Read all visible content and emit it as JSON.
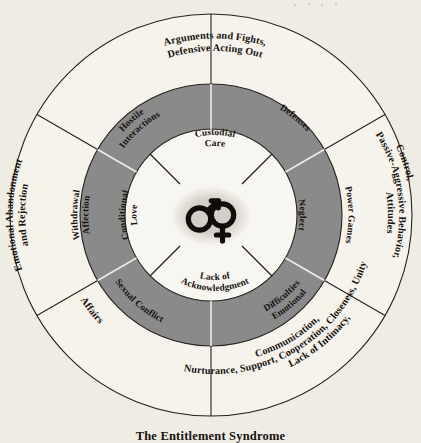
{
  "figure": {
    "caption": "The Entitlement Syndrome",
    "colors": {
      "background": "#efece4",
      "outer_ring": "#f6f3ec",
      "middle_ring": "#8a8a8a",
      "inner_circle": "#f8f6f0",
      "ink": "#16120e"
    }
  },
  "center": {
    "male_symbol": "male-gender-symbol",
    "female_symbol": "female-gender-symbol"
  },
  "inner_ring": {
    "name": "inner-circle-labels",
    "segments": [
      {
        "id": "custodial-care",
        "lines": [
          "Custodial",
          "Care"
        ]
      },
      {
        "id": "neglect",
        "lines": [
          "Neglect"
        ]
      },
      {
        "id": "lack-of-acknowledgment",
        "lines": [
          "Lack of",
          "Acknowledgment"
        ]
      },
      {
        "id": "conditional-love",
        "lines": [
          "Conditional",
          "Love"
        ]
      }
    ]
  },
  "middle_ring": {
    "name": "middle-gray-ring",
    "segments": [
      {
        "id": "defenses",
        "lines": [
          "Defenses"
        ]
      },
      {
        "id": "power-games",
        "lines": [
          "Power Games"
        ]
      },
      {
        "id": "emotional-difficulties",
        "lines": [
          "Emotional",
          "Difficulties"
        ]
      },
      {
        "id": "sexual-conflict",
        "lines": [
          "Sexual Conflict"
        ]
      },
      {
        "id": "withdrawal-affection",
        "lines": [
          "Withdrawal",
          "Affection"
        ]
      },
      {
        "id": "hostile-interactions",
        "lines": [
          "Hostile",
          "Interactions"
        ]
      }
    ]
  },
  "outer_ring": {
    "name": "outer-white-ring",
    "segments": [
      {
        "id": "arguments-and-fights",
        "lines": [
          "Arguments and Fights,",
          "Defensive Acting Out"
        ]
      },
      {
        "id": "control-passive-aggressive",
        "lines": [
          "Control,",
          "Passive-Aggressive Behavior,",
          "Attitudes"
        ]
      },
      {
        "id": "lack-of-intimacy",
        "lines": [
          "Lack of Intimacy,",
          "Nurturance, Support, Cooperation, Closeness, Unity",
          "Communication,"
        ]
      },
      {
        "id": "affairs",
        "lines": [
          "Affairs"
        ]
      },
      {
        "id": "emotional-abandonment",
        "lines": [
          "Emotional Abandonment",
          "and Rejection"
        ]
      }
    ]
  }
}
